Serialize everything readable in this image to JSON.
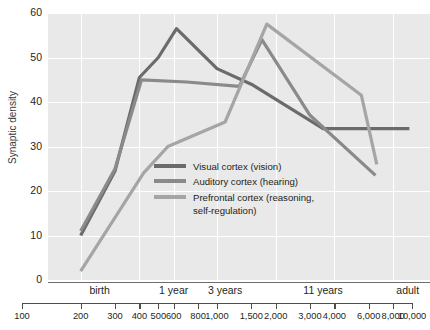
{
  "chart_data": {
    "type": "line",
    "title": "",
    "xlabel": "",
    "ylabel": "Synaptic density",
    "xscale": "log",
    "xlim": [
      100,
      10000
    ],
    "ylim": [
      0,
      60
    ],
    "yticks": [
      0,
      10,
      20,
      30,
      40,
      50,
      60
    ],
    "xticks": [
      100,
      200,
      300,
      400,
      500,
      600,
      800,
      1000,
      1500,
      2000,
      3000,
      4000,
      6000,
      8000,
      10000
    ],
    "xtick_labels": [
      "100",
      "200",
      "300",
      "400",
      "500",
      "600",
      "800",
      "1,000",
      "1,500",
      "2,000",
      "3,000",
      "4,000",
      "6,000",
      "8,000",
      "10,000"
    ],
    "x_period_labels": [
      {
        "label": "birth",
        "x": 250
      },
      {
        "label": "1 year",
        "x": 600
      },
      {
        "label": "3 years",
        "x": 1100
      },
      {
        "label": "11 years",
        "x": 3500
      },
      {
        "label": "adult",
        "x": 9500
      }
    ],
    "grid": true,
    "grid_color": "#ffffff",
    "plot_background": "#e9e9e9",
    "legend_position": "center",
    "series": [
      {
        "name": "Visual cortex (vision)",
        "color": "#6b6b6b",
        "x": [
          200,
          300,
          400,
          500,
          620,
          1000,
          1500,
          3500,
          9700
        ],
        "y": [
          10.0,
          24.5,
          45.5,
          50.0,
          56.5,
          47.5,
          44.0,
          34.0,
          34.0
        ]
      },
      {
        "name": "Auditory cortex (hearing)",
        "color": "#8a8a8a",
        "x": [
          200,
          300,
          410,
          700,
          1300,
          1700,
          3000,
          6500
        ],
        "y": [
          11.0,
          25.0,
          45.0,
          44.5,
          43.5,
          54.0,
          37.0,
          23.5
        ]
      },
      {
        "name": "Prefrontal cortex (reasoning,\nself-regulation)",
        "color": "#a5a5a5",
        "x": [
          200,
          420,
          560,
          1100,
          1800,
          5500,
          6600
        ],
        "y": [
          2.0,
          24.0,
          30.0,
          35.5,
          57.5,
          41.5,
          26.0
        ]
      }
    ]
  },
  "legend": {
    "items": [
      {
        "label": "Visual cortex (vision)",
        "color": "#6b6b6b"
      },
      {
        "label": "Auditory cortex (hearing)",
        "color": "#8a8a8a"
      },
      {
        "label": "Prefrontal cortex (reasoning,\nself-regulation)",
        "color": "#a5a5a5"
      }
    ]
  }
}
